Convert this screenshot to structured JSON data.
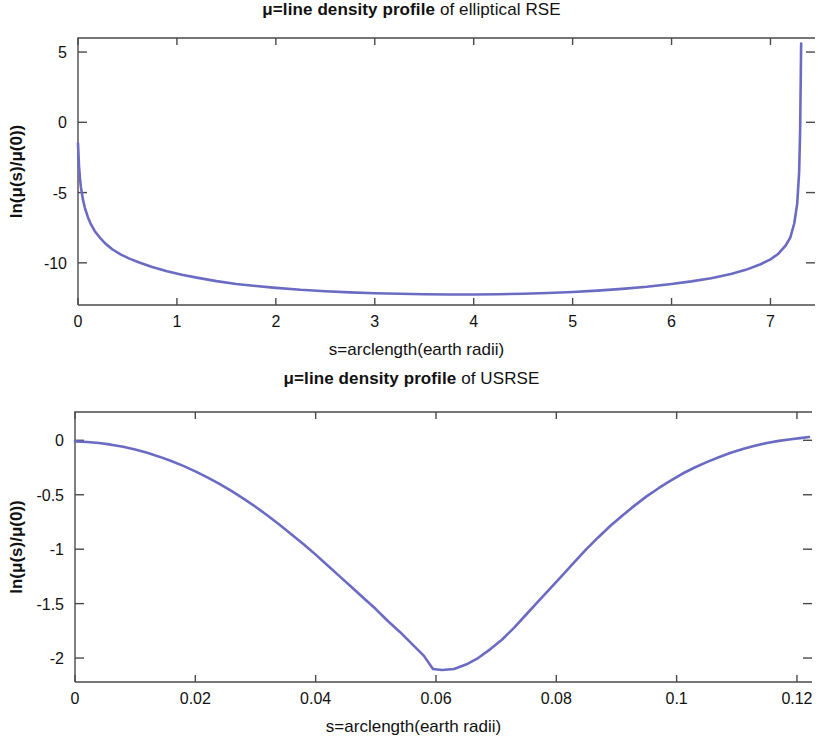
{
  "page": {
    "background": "#ffffff",
    "figure_count": 2
  },
  "chart_data": [
    {
      "id": "elliptical-rse",
      "type": "line",
      "title": "μ=line density profile of elliptical RSE",
      "title_strong": "μ=line density profile",
      "title_normal": " of elliptical RSE",
      "xlabel": "s=arclength(earth radii)",
      "ylabel": "ln(μ(s)/μ(0))",
      "xlim": [
        0,
        7.45
      ],
      "ylim": [
        -13.0,
        6.0
      ],
      "xticks": [
        0,
        1,
        2,
        3,
        4,
        5,
        6,
        7
      ],
      "xticklabels": [
        "0",
        "1",
        "2",
        "3",
        "4",
        "5",
        "6",
        "7"
      ],
      "yticks": [
        5,
        0,
        -5,
        -10
      ],
      "yticklabels": [
        "5",
        "0",
        "-5",
        "-10"
      ],
      "grid": false,
      "legend": null,
      "line_color": "#6b6bc4",
      "x": [
        0.0,
        0.01,
        0.02,
        0.03,
        0.05,
        0.07,
        0.1,
        0.13,
        0.17,
        0.22,
        0.28,
        0.35,
        0.43,
        0.52,
        0.62,
        0.75,
        0.9,
        1.05,
        1.2,
        1.4,
        1.6,
        1.8,
        2.0,
        2.25,
        2.5,
        2.75,
        3.0,
        3.25,
        3.5,
        3.75,
        4.0,
        4.25,
        4.5,
        4.75,
        5.0,
        5.25,
        5.5,
        5.75,
        6.0,
        6.2,
        6.4,
        6.6,
        6.75,
        6.9,
        7.0,
        7.08,
        7.15,
        7.2,
        7.24,
        7.27,
        7.29,
        7.3,
        7.31
      ],
      "y": [
        -1.5,
        -3.1,
        -4.0,
        -4.65,
        -5.5,
        -6.1,
        -6.75,
        -7.25,
        -7.75,
        -8.2,
        -8.65,
        -9.05,
        -9.4,
        -9.7,
        -9.98,
        -10.3,
        -10.6,
        -10.85,
        -11.05,
        -11.3,
        -11.5,
        -11.65,
        -11.78,
        -11.92,
        -12.02,
        -12.1,
        -12.16,
        -12.2,
        -12.23,
        -12.25,
        -12.25,
        -12.23,
        -12.2,
        -12.15,
        -12.08,
        -11.98,
        -11.85,
        -11.7,
        -11.5,
        -11.32,
        -11.1,
        -10.8,
        -10.5,
        -10.1,
        -9.75,
        -9.35,
        -8.8,
        -8.2,
        -7.2,
        -5.8,
        -3.5,
        -0.5,
        5.6
      ]
    },
    {
      "id": "usrse",
      "type": "line",
      "title": "μ=line density profile of USRSE",
      "title_strong": "μ=line density profile",
      "title_normal": " of USRSE",
      "xlabel": "s=arclength(earth radii)",
      "ylabel": "ln(μ(s)/μ(0))",
      "xlim": [
        0,
        0.1225
      ],
      "ylim": [
        -2.22,
        0.26
      ],
      "xticks": [
        0,
        0.02,
        0.04,
        0.06,
        0.08,
        0.1,
        0.12
      ],
      "xticklabels": [
        "0",
        "0.02",
        "0.04",
        "0.06",
        "0.08",
        "0.1",
        "0.12"
      ],
      "yticks": [
        0,
        -0.5,
        -1,
        -1.5,
        -2
      ],
      "yticklabels": [
        "0",
        "-0.5",
        "-1",
        "-1.5",
        "-2"
      ],
      "grid": false,
      "legend": null,
      "line_color": "#6b6bc4",
      "x": [
        0.0,
        0.002,
        0.004,
        0.006,
        0.008,
        0.01,
        0.012,
        0.014,
        0.016,
        0.018,
        0.02,
        0.022,
        0.024,
        0.026,
        0.028,
        0.03,
        0.032,
        0.034,
        0.036,
        0.038,
        0.04,
        0.042,
        0.044,
        0.046,
        0.048,
        0.05,
        0.052,
        0.054,
        0.056,
        0.058,
        0.0595,
        0.061,
        0.063,
        0.065,
        0.067,
        0.069,
        0.071,
        0.073,
        0.075,
        0.077,
        0.079,
        0.081,
        0.083,
        0.085,
        0.087,
        0.089,
        0.091,
        0.093,
        0.095,
        0.097,
        0.099,
        0.101,
        0.103,
        0.105,
        0.107,
        0.109,
        0.111,
        0.113,
        0.115,
        0.117,
        0.119,
        0.1205,
        0.122
      ],
      "y": [
        -0.01,
        -0.015,
        -0.025,
        -0.04,
        -0.06,
        -0.085,
        -0.115,
        -0.15,
        -0.19,
        -0.235,
        -0.285,
        -0.34,
        -0.4,
        -0.465,
        -0.535,
        -0.61,
        -0.69,
        -0.775,
        -0.865,
        -0.955,
        -1.05,
        -1.15,
        -1.25,
        -1.35,
        -1.45,
        -1.55,
        -1.66,
        -1.76,
        -1.87,
        -1.98,
        -2.1,
        -2.11,
        -2.1,
        -2.06,
        -2.0,
        -1.92,
        -1.83,
        -1.72,
        -1.6,
        -1.48,
        -1.36,
        -1.24,
        -1.12,
        -1.0,
        -0.89,
        -0.785,
        -0.69,
        -0.6,
        -0.515,
        -0.44,
        -0.37,
        -0.305,
        -0.25,
        -0.2,
        -0.155,
        -0.115,
        -0.08,
        -0.05,
        -0.025,
        -0.005,
        0.01,
        0.02,
        0.03
      ]
    }
  ]
}
